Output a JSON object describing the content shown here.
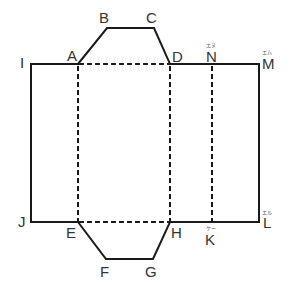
{
  "diagram": {
    "colors": {
      "line": "#1a1a1a",
      "label": "#333333",
      "ruby": "#555555",
      "background": "#ffffff"
    },
    "vertices": {
      "A": {
        "label": "A",
        "x": 78,
        "y": 64
      },
      "B": {
        "label": "B",
        "x": 107,
        "y": 28
      },
      "C": {
        "label": "C",
        "x": 154,
        "y": 28
      },
      "D": {
        "label": "D",
        "x": 170,
        "y": 64
      },
      "E": {
        "label": "E",
        "x": 78,
        "y": 222
      },
      "F": {
        "label": "F",
        "x": 106,
        "y": 259
      },
      "G": {
        "label": "G",
        "x": 153,
        "y": 259
      },
      "H": {
        "label": "H",
        "x": 170,
        "y": 222
      },
      "I": {
        "label": "I",
        "x": 31,
        "y": 64
      },
      "J": {
        "label": "J",
        "x": 31,
        "y": 222
      },
      "K": {
        "label": "K",
        "x": 212,
        "y": 222,
        "ruby": "ケー"
      },
      "L": {
        "label": "L",
        "x": 259,
        "y": 222,
        "ruby": "エル"
      },
      "M": {
        "label": "M",
        "x": 259,
        "y": 64,
        "ruby": "エム"
      },
      "N": {
        "label": "N",
        "x": 212,
        "y": 64,
        "ruby": "エヌ"
      }
    },
    "solid_edges": [
      "I-M (top edge)",
      "M-L (right edge)",
      "L-J (bottom edge)",
      "J-I (left edge)",
      "A-B-C-D (top trapezoid flap)",
      "E-F-G-H (bottom trapezoid flap)"
    ],
    "dashed_edges": [
      "A-D (fold)",
      "E-H (fold)",
      "A-E (fold)",
      "D-H (fold)",
      "N-K (fold)"
    ]
  }
}
